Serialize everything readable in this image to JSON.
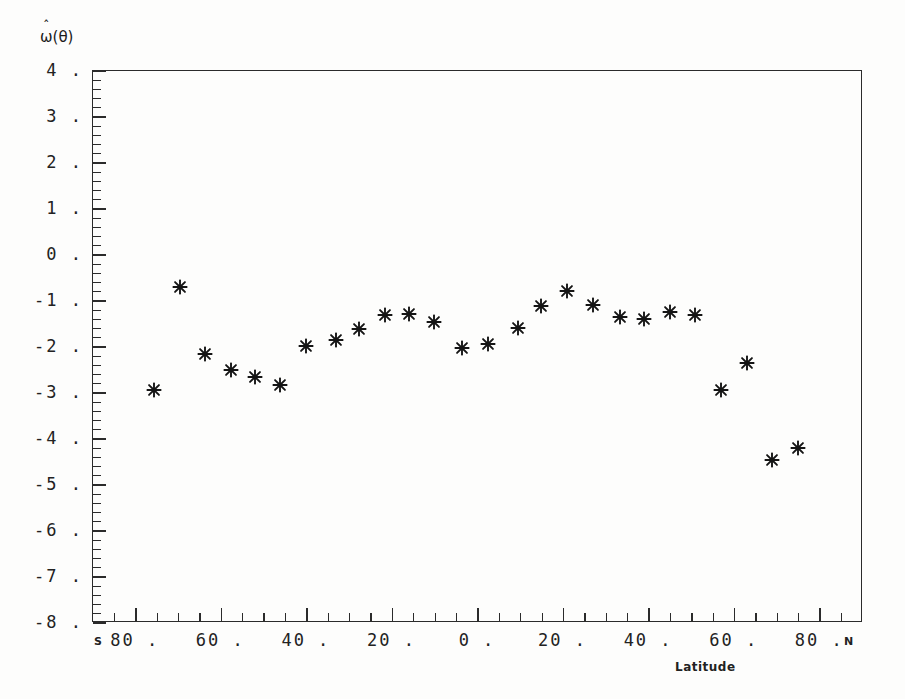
{
  "figure": {
    "ylabel": "ω(θ)",
    "ylabel_base": "ω",
    "ylabel_hat": "ˆ",
    "ylabel_arg": "(θ)",
    "xlabel": "Latitude",
    "south_cap": "S",
    "north_cap": "N",
    "marker_color": "#151515",
    "axis_color": "#2b2b2b",
    "background": "#fdfdfc"
  },
  "axes": {
    "y_tick_labels": [
      "4 .",
      "3 .",
      "2 .",
      "1 .",
      "0 .",
      "-1 .",
      "-2 .",
      "-3 .",
      "-4 .",
      "-5 .",
      "-6 .",
      "-7 .",
      "-8 ."
    ],
    "y_tick_values": [
      4,
      3,
      2,
      1,
      0,
      -1,
      -2,
      -3,
      -4,
      -5,
      -6,
      -7,
      -8
    ],
    "y_minor_per_major": 5,
    "x_tick_labels": [
      "80 .",
      "60 .",
      "40 .",
      "20 .",
      "0 .",
      "20 .",
      "40 .",
      "60 .",
      "80 ."
    ],
    "x_tick_values": [
      -80,
      -60,
      -40,
      -20,
      0,
      20,
      40,
      60,
      80
    ],
    "x_minor_per_major": 4
  },
  "chart_data": {
    "type": "scatter",
    "title": "",
    "xlabel": "Latitude",
    "ylabel": "ω̂(θ)",
    "xlim": [
      -90,
      90
    ],
    "ylim": [
      -8,
      4
    ],
    "grid": false,
    "legend": null,
    "marker": "asterisk",
    "x_axis_note": "Negative x = South latitude (S), positive x = North latitude (N)",
    "series": [
      {
        "name": "omega-hat estimate",
        "points": [
          {
            "x": -75.5,
            "y": -2.95
          },
          {
            "x": -69.5,
            "y": -0.72
          },
          {
            "x": -63.5,
            "y": -2.17
          },
          {
            "x": -57.5,
            "y": -2.52
          },
          {
            "x": -52.0,
            "y": -2.68
          },
          {
            "x": -46.0,
            "y": -2.85
          },
          {
            "x": -40.0,
            "y": -2.0
          },
          {
            "x": -33.0,
            "y": -1.88
          },
          {
            "x": -27.5,
            "y": -1.63
          },
          {
            "x": -21.5,
            "y": -1.32
          },
          {
            "x": -16.0,
            "y": -1.31
          },
          {
            "x": -10.0,
            "y": -1.48
          },
          {
            "x": -3.5,
            "y": -2.05
          },
          {
            "x": 2.5,
            "y": -1.95
          },
          {
            "x": 9.5,
            "y": -1.6
          },
          {
            "x": 15.0,
            "y": -1.12
          },
          {
            "x": 21.0,
            "y": -0.8
          },
          {
            "x": 27.0,
            "y": -1.1
          },
          {
            "x": 33.5,
            "y": -1.38
          },
          {
            "x": 39.0,
            "y": -1.42
          },
          {
            "x": 45.0,
            "y": -1.25
          },
          {
            "x": 51.0,
            "y": -1.32
          },
          {
            "x": 57.0,
            "y": -2.95
          },
          {
            "x": 63.0,
            "y": -2.38
          },
          {
            "x": 69.0,
            "y": -4.47
          },
          {
            "x": 75.0,
            "y": -4.22
          }
        ]
      }
    ]
  }
}
